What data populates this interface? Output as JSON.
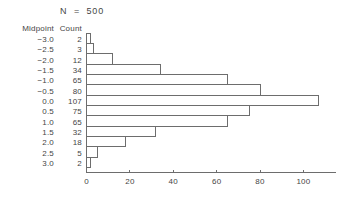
{
  "figure": {
    "title": "N  =  500",
    "background_color": "#ffffff",
    "line_color": "#6d6d6d",
    "text_color": "#454545"
  },
  "table": {
    "headers": {
      "midpoint": "Midpoint",
      "count": "Count"
    },
    "rows": [
      {
        "midpoint": "-3.0",
        "count": "2"
      },
      {
        "midpoint": "-2.5",
        "count": "3"
      },
      {
        "midpoint": "-2.0",
        "count": "12"
      },
      {
        "midpoint": "-1.5",
        "count": "34"
      },
      {
        "midpoint": "-1.0",
        "count": "65"
      },
      {
        "midpoint": "-0.5",
        "count": "80"
      },
      {
        "midpoint": "0.0",
        "count": "107"
      },
      {
        "midpoint": "0.5",
        "count": "75"
      },
      {
        "midpoint": "1.0",
        "count": "65"
      },
      {
        "midpoint": "1.5",
        "count": "32"
      },
      {
        "midpoint": "2.0",
        "count": "18"
      },
      {
        "midpoint": "2.5",
        "count": "5"
      },
      {
        "midpoint": "3.0",
        "count": "2"
      }
    ]
  },
  "axis": {
    "tick_labels": [
      "0",
      "20",
      "40",
      "60",
      "80",
      "100"
    ],
    "tick_values": [
      0,
      20,
      40,
      60,
      80,
      100
    ]
  },
  "chart_data": {
    "type": "bar",
    "orientation": "horizontal",
    "title": "N  =  500",
    "xlabel": "",
    "ylabel": "",
    "categories": [
      "-3.0",
      "-2.5",
      "-2.0",
      "-1.5",
      "-1.0",
      "-0.5",
      "0.0",
      "0.5",
      "1.0",
      "1.5",
      "2.0",
      "2.5",
      "3.0"
    ],
    "category_name": "Midpoint",
    "series": [
      {
        "name": "Count",
        "values": [
          2,
          3,
          12,
          34,
          65,
          80,
          107,
          75,
          65,
          32,
          18,
          5,
          2
        ]
      }
    ],
    "total_n": 500,
    "xlim": [
      0,
      115
    ],
    "xticks": [
      0,
      20,
      40,
      60,
      80,
      100
    ],
    "grid": false,
    "legend": "none",
    "bar_fill": "none",
    "bar_stroke": "#6d6d6d"
  }
}
